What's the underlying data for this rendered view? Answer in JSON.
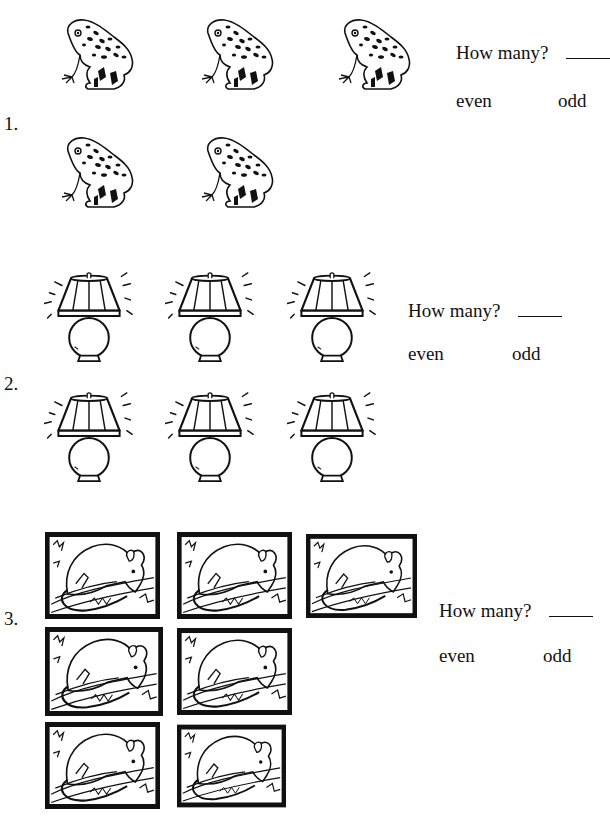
{
  "problems": [
    {
      "number": "1.",
      "object": "frog",
      "count_visible": 5,
      "question": "How many?",
      "blank": "_____",
      "choice_even": "even",
      "choice_odd": "odd"
    },
    {
      "number": "2.",
      "object": "lamp",
      "count_visible": 6,
      "question": "How many?",
      "blank": "_____",
      "choice_even": "even",
      "choice_odd": "odd"
    },
    {
      "number": "3.",
      "object": "opossum",
      "count_visible": 7,
      "question": "How many?",
      "blank": "_____",
      "choice_even": "even",
      "choice_odd": "odd"
    }
  ],
  "icons": {
    "frog": "frog-icon",
    "lamp": "lamp-icon",
    "opossum": "opossum-icon"
  }
}
